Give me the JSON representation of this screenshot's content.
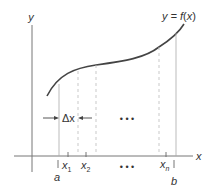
{
  "diagram": {
    "type": "riemann-partition",
    "axes": {
      "x_label": "x",
      "y_label": "y"
    },
    "curve": {
      "label": "y = f(x)",
      "label_parts": [
        "y = ",
        "f",
        "(",
        "x",
        ")"
      ]
    },
    "partition": {
      "start_label": "a",
      "end_label": "b",
      "points": [
        {
          "base": "x",
          "sub": "1"
        },
        {
          "base": "x",
          "sub": "2"
        },
        {
          "base": "x",
          "sub": "n"
        }
      ],
      "ellipsis": "• • •",
      "width_label": "Δx"
    },
    "colors": {
      "curve": "#444444",
      "axis": "#666666",
      "solid_line": "#999999",
      "dashed_line": "#aaaaaa",
      "text": "#333333"
    }
  }
}
